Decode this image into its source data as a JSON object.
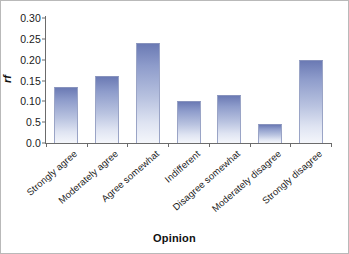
{
  "chart_data": {
    "type": "bar",
    "title": "",
    "xlabel": "Opinion",
    "ylabel": "rf",
    "categories": [
      "Strongly agree",
      "Moderately agree",
      "Agree somewhat",
      "Indifferent",
      "Disagree somewhat",
      "Moderately disagree",
      "Strongly disagree"
    ],
    "values": [
      0.135,
      0.16,
      0.24,
      0.1,
      0.115,
      0.045,
      0.2
    ],
    "ylim": [
      0.0,
      0.3
    ],
    "ytick_values": [
      0.3,
      0.25,
      0.2,
      0.15,
      0.1,
      0.05,
      0.0
    ],
    "ytick_labels": [
      "0.30",
      "0.25",
      "0.20",
      "0.15",
      "0.10",
      "0.5",
      "0.0"
    ],
    "grid": false,
    "legend": null,
    "bar_color_top": "#6b7ab4",
    "bar_color_bottom": "#f4f6fb",
    "axis_color": "#6b6b6b",
    "background": "#ffffff",
    "border_color": "#b9b9b9"
  }
}
